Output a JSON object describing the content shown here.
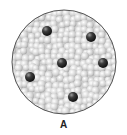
{
  "diagram": {
    "label": "A",
    "container": {
      "cx": 64,
      "cy": 62,
      "r": 52,
      "stroke": "#555555"
    },
    "background_particle_color": "#d8d8d8",
    "solute_particle_color": "#3a3a3a",
    "solute_particles": [
      {
        "x": 47,
        "y": 31
      },
      {
        "x": 91,
        "y": 37
      },
      {
        "x": 62,
        "y": 63
      },
      {
        "x": 103,
        "y": 63
      },
      {
        "x": 30,
        "y": 77
      },
      {
        "x": 73,
        "y": 97
      }
    ]
  }
}
